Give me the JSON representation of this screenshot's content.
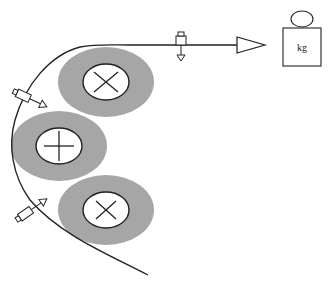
{
  "diagram": {
    "type": "web tension / roller schematic",
    "colors": {
      "line": "#222222",
      "roller_outer": "#a6a6a6",
      "roller_inner": "#ffffff",
      "background": "#ffffff"
    },
    "rollers": [
      {
        "id": "top",
        "symbol": "cross-x",
        "cx": 106,
        "cy": 82
      },
      {
        "id": "middle",
        "symbol": "plus",
        "cx": 59,
        "cy": 146
      },
      {
        "id": "bottom",
        "symbol": "cross-x",
        "cx": 106,
        "cy": 210
      }
    ],
    "weight": {
      "label": "kg"
    },
    "arrow": {
      "direction": "right"
    },
    "sensors": [
      {
        "id": "top-sensor",
        "position": "on horizontal web"
      },
      {
        "id": "upper-left-sensor",
        "position": "left, near top roller"
      },
      {
        "id": "lower-left-sensor",
        "position": "left, near bottom roller"
      }
    ]
  }
}
